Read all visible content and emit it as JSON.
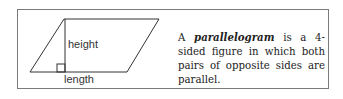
{
  "diagram": {
    "shape": "parallelogram",
    "labels": {
      "height": "height",
      "length": "length"
    }
  },
  "definition": {
    "prefix": "A",
    "term": "parallelogram",
    "suffix": "is a 4-sided figure in which both pairs of opposite sides are parallel."
  },
  "colors": {
    "line": "#333333",
    "border": "#7a7a7a"
  }
}
